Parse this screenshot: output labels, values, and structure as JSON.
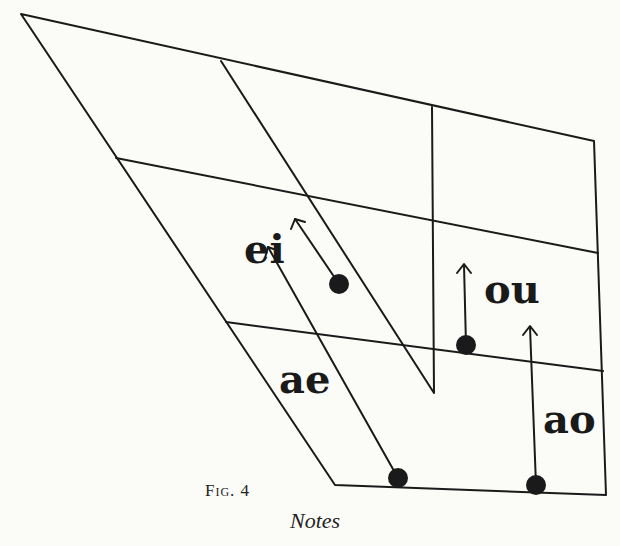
{
  "figure": {
    "caption": "Fig. 4",
    "running_head": "Notes",
    "colors": {
      "ink": "#1a1a1a",
      "paper": "#fbfbf8"
    },
    "vowel_labels": [
      {
        "id": "ei",
        "text": "ei"
      },
      {
        "id": "ou",
        "text": "ou"
      },
      {
        "id": "ae",
        "text": "ae"
      },
      {
        "id": "ao",
        "text": "ao"
      }
    ],
    "diphthongs": [
      {
        "label": "ei",
        "start": [
          339,
          284
        ],
        "end": [
          295,
          219
        ]
      },
      {
        "label": "ae",
        "start": [
          398,
          478
        ],
        "end": [
          268,
          247
        ]
      },
      {
        "label": "ou",
        "start": [
          466,
          345
        ],
        "end": [
          464,
          265
        ]
      },
      {
        "label": "ao",
        "start": [
          536,
          485
        ],
        "end": [
          530,
          327
        ]
      }
    ]
  }
}
